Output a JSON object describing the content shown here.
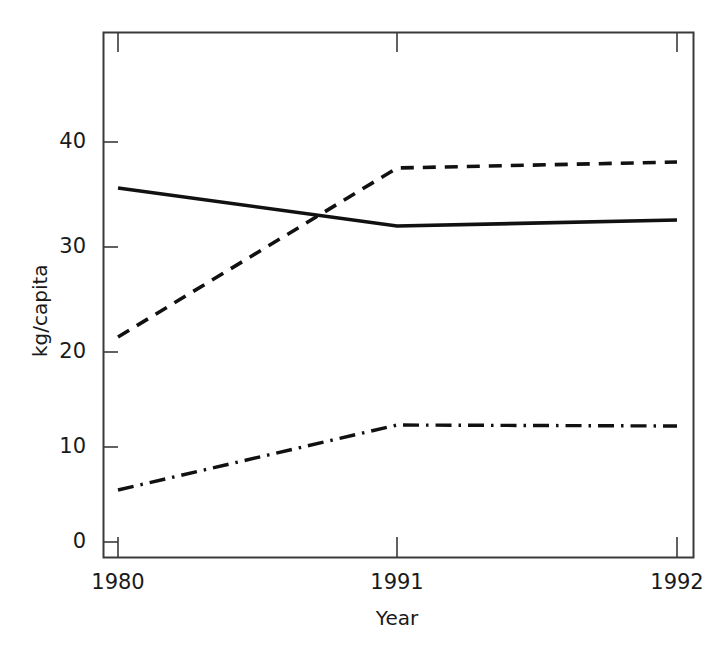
{
  "chart_data": {
    "type": "line",
    "title": "",
    "subtitle": "",
    "xlabel": "Year",
    "ylabel": "kg/capita",
    "categories": [
      "1980",
      "1991",
      "1992"
    ],
    "x": [
      1980,
      1991,
      1992
    ],
    "xtick_labels": [
      "1980",
      "1991",
      "1992"
    ],
    "ytick_labels": [
      "0",
      "10",
      "20",
      "30",
      "40"
    ],
    "ytick_values": [
      0,
      10,
      20,
      30,
      40
    ],
    "ylim": [
      0,
      49
    ],
    "xlim_categorical": true,
    "grid": false,
    "legend": "none",
    "frame": "box",
    "series": [
      {
        "name": "series-solid",
        "style": "solid",
        "color": "#111111",
        "values": [
          35.4,
          31.6,
          32.2
        ]
      },
      {
        "name": "series-dashed",
        "style": "dashed",
        "color": "#111111",
        "values": [
          20.5,
          37.4,
          38.0
        ]
      },
      {
        "name": "series-dashdot",
        "style": "dashdot",
        "color": "#111111",
        "values": [
          5.2,
          11.7,
          11.6
        ]
      }
    ],
    "annotations": []
  },
  "axis": {
    "y_label_text": "kg/capita",
    "x_label_text": "Year",
    "y_ticks": [
      {
        "label": "0",
        "value": 0
      },
      {
        "label": "10",
        "value": 10
      },
      {
        "label": "20",
        "value": 20
      },
      {
        "label": "30",
        "value": 30
      },
      {
        "label": "40",
        "value": 40
      }
    ],
    "x_ticks": [
      {
        "label": "1980"
      },
      {
        "label": "1991"
      },
      {
        "label": "1992"
      }
    ]
  },
  "colors": {
    "frame": "#3a3a3a",
    "series": "#111111",
    "background": "#ffffff",
    "text": "#1a1a1a"
  }
}
